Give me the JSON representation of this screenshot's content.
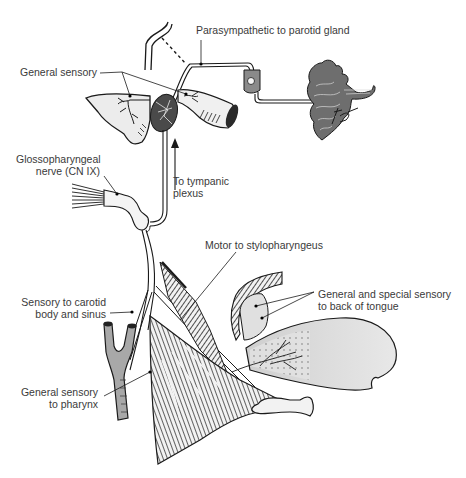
{
  "figure": {
    "colors": {
      "ink": "#1a1a1a",
      "nerve_fill": "#f4f4f4",
      "organ_fill": "#e6e6e6",
      "dark_fill": "#555555",
      "label_text": "#3a3a3a"
    }
  },
  "labels": {
    "parasympathetic": "Parasympathetic to parotid gland",
    "general_sensory_top": "General sensory",
    "glossopharyngeal": [
      "Glossopharyngeal",
      "nerve (CN IX)"
    ],
    "tympanic": [
      "To tympanic",
      "plexus"
    ],
    "motor": "Motor to stylopharyngeus",
    "tongue": [
      "General and special sensory",
      "to back of tongue"
    ],
    "carotid": [
      "Sensory to carotid",
      "body and sinus"
    ],
    "pharynx": [
      "General sensory",
      "to pharynx"
    ]
  },
  "signature": "DC"
}
